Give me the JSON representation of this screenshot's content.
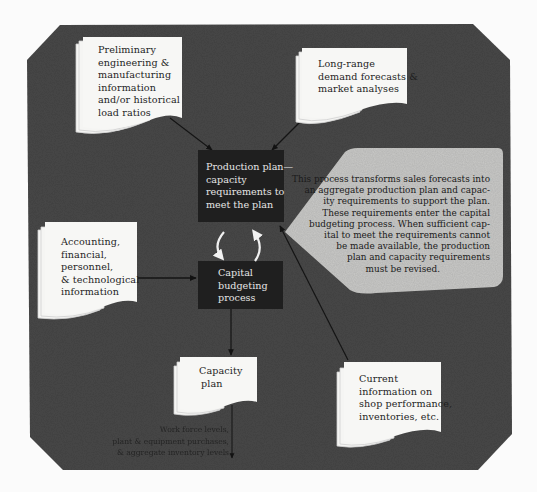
{
  "diagram": {
    "colors": {
      "frame": "#4a4a4a",
      "process_box": "#1f1f1f",
      "document": "#f7f7f5",
      "callout": "#c8c8c6",
      "page_bg": "#fbfbfb",
      "arrow": "#151515"
    },
    "inputs": {
      "engineering": {
        "lines": [
          "Preliminary",
          "engineering &",
          "manufacturing",
          "information",
          "and/or historical",
          "load ratios"
        ]
      },
      "forecasts": {
        "lines": [
          "Long-range",
          "demand forecasts &",
          "market analyses"
        ]
      },
      "accounting": {
        "lines": [
          "Accounting,",
          "financial,",
          "personnel,",
          "& technological",
          "information"
        ]
      },
      "shop_info": {
        "lines": [
          "Current",
          "information on",
          "shop performance,",
          "inventories, etc."
        ]
      }
    },
    "processes": {
      "production_plan": {
        "lines": [
          "Production plan—",
          "capacity",
          "requirements to",
          "meet the plan"
        ]
      },
      "capital_budgeting": {
        "lines": [
          "Capital",
          "budgeting",
          "process"
        ]
      }
    },
    "outputs": {
      "capacity_plan": {
        "lines": [
          "Capacity",
          "plan"
        ]
      },
      "results": {
        "lines": [
          "Work force levels,",
          "plant & equipment purchases,",
          "& aggregate inventory levels"
        ]
      }
    },
    "callout": {
      "lines": [
        "This process transforms sales forecasts into",
        "an aggregate production plan and capac-",
        "ity requirements to support the plan.",
        "These requirements enter the capital",
        "budgeting process. When sufficient cap-",
        "ital to meet the requirements cannot",
        "be made available, the production",
        "plan and capacity requirements",
        "must be revised."
      ]
    },
    "edges": [
      {
        "from": "engineering",
        "to": "production_plan"
      },
      {
        "from": "forecasts",
        "to": "production_plan"
      },
      {
        "from": "shop_info",
        "to": "production_plan"
      },
      {
        "from": "accounting",
        "to": "capital_budgeting"
      },
      {
        "from": "production_plan",
        "to": "capital_budgeting",
        "style": "curved-white"
      },
      {
        "from": "capital_budgeting",
        "to": "production_plan",
        "style": "curved-white"
      },
      {
        "from": "capital_budgeting",
        "to": "capacity_plan"
      },
      {
        "from": "capacity_plan",
        "to": "results"
      }
    ]
  }
}
